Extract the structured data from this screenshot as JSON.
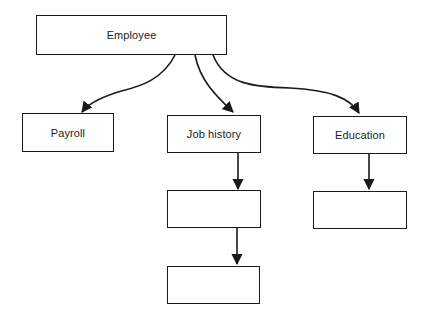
{
  "diagram": {
    "type": "hierarchy",
    "nodes": [
      {
        "id": "employee",
        "label": "Employee"
      },
      {
        "id": "payroll",
        "label": "Payroll"
      },
      {
        "id": "job_history",
        "label": "Job history"
      },
      {
        "id": "education",
        "label": "Education"
      },
      {
        "id": "job_history_child_1",
        "label": ""
      },
      {
        "id": "job_history_child_2",
        "label": ""
      },
      {
        "id": "education_child_1",
        "label": ""
      }
    ],
    "edges": [
      {
        "from": "employee",
        "to": "payroll",
        "style": "curved-arrow"
      },
      {
        "from": "employee",
        "to": "job_history",
        "style": "curved-arrow"
      },
      {
        "from": "employee",
        "to": "education",
        "style": "curved-arrow"
      },
      {
        "from": "job_history",
        "to": "job_history_child_1",
        "style": "straight-arrow"
      },
      {
        "from": "job_history_child_1",
        "to": "job_history_child_2",
        "style": "straight-arrow"
      },
      {
        "from": "education",
        "to": "education_child_1",
        "style": "straight-arrow"
      }
    ],
    "colors": {
      "stroke": "#1a1a1a",
      "background": "#ffffff"
    }
  }
}
